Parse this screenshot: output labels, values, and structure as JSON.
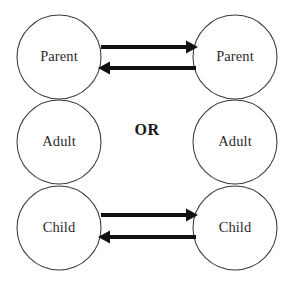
{
  "diagram": {
    "connector_label": "OR",
    "colors": {
      "background": "#ffffff",
      "circle_stroke": "#3a3a3a",
      "circle_fill": "#ffffff",
      "label_text": "#2b2b2b",
      "arrow": "#111111",
      "or_text": "#1a1a1a"
    },
    "left_column": {
      "name": "left-person",
      "states": [
        {
          "label": "Parent",
          "cx": 59,
          "cy": 57,
          "r": 42
        },
        {
          "label": "Adult",
          "cx": 59,
          "cy": 142,
          "r": 42
        },
        {
          "label": "Child",
          "cx": 59,
          "cy": 228,
          "r": 42
        }
      ]
    },
    "right_column": {
      "name": "right-person",
      "states": [
        {
          "label": "Parent",
          "cx": 235,
          "cy": 57,
          "r": 42
        },
        {
          "label": "Adult",
          "cx": 235,
          "cy": 142,
          "r": 42
        },
        {
          "label": "Child",
          "cx": 235,
          "cy": 228,
          "r": 42
        }
      ]
    },
    "transactions": [
      {
        "name": "parent-to-parent-stimulus",
        "direction": "right",
        "from": "left Parent",
        "to": "right Parent",
        "y": 47,
        "x_start": 101,
        "x_end": 197
      },
      {
        "name": "parent-to-parent-response",
        "direction": "left",
        "from": "right Parent",
        "to": "left Parent",
        "y": 68,
        "x_start": 195,
        "x_end": 99
      },
      {
        "name": "child-to-child-stimulus",
        "direction": "right",
        "from": "left Child",
        "to": "right Child",
        "y": 215,
        "x_start": 101,
        "x_end": 197
      },
      {
        "name": "child-to-child-response",
        "direction": "left",
        "from": "right Child",
        "to": "left Child",
        "y": 237,
        "x_start": 195,
        "x_end": 99
      }
    ]
  }
}
